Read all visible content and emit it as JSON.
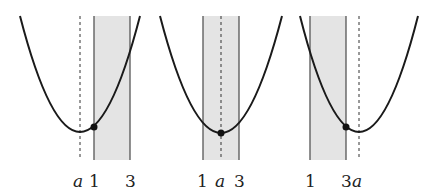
{
  "diagram": {
    "colors": {
      "curve": "#1a1a1a",
      "band": "#e4e4e4",
      "band_edge": "#555555",
      "axis_dash": "#333333"
    },
    "panels": [
      {
        "case": "a < 1",
        "labels": {
          "a": "a",
          "one": "1",
          "three": "3"
        }
      },
      {
        "case": "1 ≤ a ≤ 3",
        "labels": {
          "a": "a",
          "one": "1",
          "three": "3"
        }
      },
      {
        "case": "a > 3",
        "labels": {
          "a": "a",
          "one": "1",
          "three": "3"
        }
      }
    ]
  }
}
